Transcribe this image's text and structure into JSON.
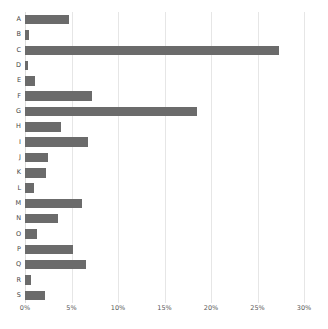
{
  "chart_data": {
    "type": "bar",
    "orientation": "horizontal",
    "title": "",
    "subtitle": "",
    "xlabel": "",
    "ylabel": "",
    "xlim": [
      0,
      30
    ],
    "ylim": null,
    "grid": "vertical",
    "legend": null,
    "legend_position": "none",
    "bar_color": "#6b6b6b",
    "background_color": "#ffffff",
    "gridline_color": "#e6e6e6",
    "x_tick_labels": [
      "0%",
      "5%",
      "10%",
      "15%",
      "20%",
      "25%",
      "30%"
    ],
    "x_tick_values": [
      0,
      5,
      10,
      15,
      20,
      25,
      30
    ],
    "categories": [
      "A",
      "B",
      "C",
      "D",
      "E",
      "F",
      "G",
      "H",
      "I",
      "J",
      "K",
      "L",
      "M",
      "N",
      "O",
      "P",
      "Q",
      "R",
      "S"
    ],
    "values": [
      4.7,
      0.4,
      27.3,
      0.35,
      1.1,
      7.2,
      18.5,
      3.9,
      6.8,
      2.5,
      2.3,
      1.0,
      6.1,
      3.5,
      1.3,
      5.2,
      6.6,
      0.6,
      2.1
    ],
    "units": "percent"
  }
}
